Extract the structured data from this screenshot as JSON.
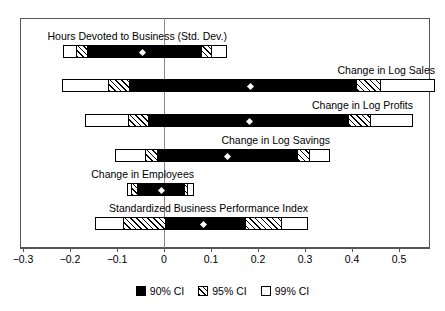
{
  "chart_data": {
    "type": "bar",
    "chart_subtype": "confidence-interval-forest-plot",
    "title": "",
    "xlabel": "",
    "ylabel": "",
    "xlim": [
      -0.3,
      0.58
    ],
    "xticks": [
      -0.3,
      -0.2,
      -0.1,
      0,
      0.1,
      0.2,
      0.3,
      0.4,
      0.5
    ],
    "xticklabels": [
      "−0.3",
      "−0.2",
      "−0.1",
      "0",
      "0.1",
      "0.2",
      "0.3",
      "0.4",
      "0.5"
    ],
    "grid": false,
    "zero_reference_line": 0,
    "legend_position": "below",
    "legend": [
      {
        "label": "90% CI",
        "style": "solid-black"
      },
      {
        "label": "95% CI",
        "style": "hatched"
      },
      {
        "label": "99% CI",
        "style": "white"
      }
    ],
    "categories": [
      "Hours Devoted to Business (Std. Dev.)",
      "Change in Log Sales",
      "Change in Log Profits",
      "Change in Log Savings",
      "Change in Employees",
      "Standardized Business Performance Index"
    ],
    "series": [
      {
        "name": "Hours Devoted to Business (Std. Dev.)",
        "estimate": -0.045,
        "ci90": [
          -0.163,
          0.081
        ],
        "ci95": [
          -0.187,
          0.102
        ],
        "ci99": [
          -0.215,
          0.134
        ]
      },
      {
        "name": "Change in Log Sales",
        "estimate": 0.183,
        "ci90": [
          -0.074,
          0.411
        ],
        "ci95": [
          -0.12,
          0.462
        ],
        "ci99": [
          -0.217,
          0.577
        ]
      },
      {
        "name": "Change in Log Profits",
        "estimate": 0.181,
        "ci90": [
          -0.034,
          0.394
        ],
        "ci95": [
          -0.077,
          0.441
        ],
        "ci99": [
          -0.168,
          0.53
        ]
      },
      {
        "name": "Change in Log Savings",
        "estimate": 0.136,
        "ci90": [
          -0.015,
          0.285
        ],
        "ci95": [
          -0.04,
          0.311
        ],
        "ci99": [
          -0.104,
          0.353
        ]
      },
      {
        "name": "Change in Employees",
        "estimate": -0.006,
        "ci90": [
          -0.057,
          0.045
        ],
        "ci95": [
          -0.07,
          0.051
        ],
        "ci99": [
          -0.079,
          0.064
        ]
      },
      {
        "name": "Standardized Business Performance Index",
        "estimate": 0.083,
        "ci90": [
          0.002,
          0.174
        ],
        "ci95": [
          -0.087,
          0.251
        ],
        "ci99": [
          -0.147,
          0.306
        ]
      }
    ]
  },
  "axis": {
    "ticks": [
      {
        "value": -0.3,
        "label": "−0.3"
      },
      {
        "value": -0.2,
        "label": "−0.2"
      },
      {
        "value": -0.1,
        "label": "−0.1"
      },
      {
        "value": 0,
        "label": "0"
      },
      {
        "value": 0.1,
        "label": "0.1"
      },
      {
        "value": 0.2,
        "label": "0.2"
      },
      {
        "value": 0.3,
        "label": "0.3"
      },
      {
        "value": 0.4,
        "label": "0.4"
      },
      {
        "value": 0.5,
        "label": "0.5"
      }
    ]
  },
  "legend": {
    "items": [
      {
        "label": "90% CI",
        "kind": "ci90"
      },
      {
        "label": "95% CI",
        "kind": "ci95"
      },
      {
        "label": "99% CI",
        "kind": "ci99"
      }
    ]
  }
}
